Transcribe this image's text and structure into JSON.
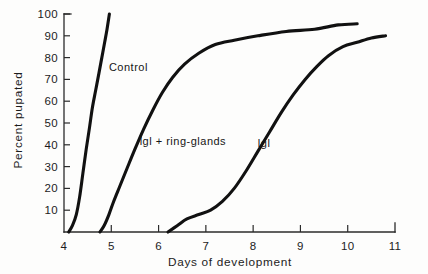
{
  "chart_data": {
    "type": "line",
    "title": "",
    "xlabel": "Days of development",
    "ylabel": "Percent pupated",
    "xlim": [
      4,
      11
    ],
    "ylim": [
      0,
      100
    ],
    "grid": false,
    "legend_position": "inline-annotations",
    "xticks": [
      "4",
      "5",
      "6",
      "7",
      "8",
      "9",
      "10",
      "11"
    ],
    "xtick_values": [
      4,
      5,
      6,
      7,
      8,
      9,
      10,
      11
    ],
    "yticks": [
      "10",
      "20",
      "30",
      "40",
      "50",
      "60",
      "70",
      "80",
      "90",
      "100"
    ],
    "ytick_values": [
      10,
      20,
      30,
      40,
      50,
      60,
      70,
      80,
      90,
      100
    ],
    "series": [
      {
        "name": "Control",
        "label": "Control",
        "label_x": 4.95,
        "label_y": 74,
        "points": [
          [
            4.1,
            0
          ],
          [
            4.18,
            3
          ],
          [
            4.26,
            8
          ],
          [
            4.33,
            16
          ],
          [
            4.4,
            27
          ],
          [
            4.47,
            38
          ],
          [
            4.54,
            48
          ],
          [
            4.6,
            57
          ],
          [
            4.67,
            65
          ],
          [
            4.74,
            73
          ],
          [
            4.8,
            80
          ],
          [
            4.86,
            87
          ],
          [
            4.91,
            93
          ],
          [
            4.96,
            100
          ]
        ]
      },
      {
        "name": "lgl + ring-glands",
        "label": "lgl + ring-glands",
        "label_x": 5.6,
        "label_y": 40,
        "points": [
          [
            4.76,
            0
          ],
          [
            4.85,
            3
          ],
          [
            4.95,
            8
          ],
          [
            5.05,
            14
          ],
          [
            5.18,
            21
          ],
          [
            5.33,
            29
          ],
          [
            5.5,
            38
          ],
          [
            5.68,
            47
          ],
          [
            5.88,
            56
          ],
          [
            6.08,
            64
          ],
          [
            6.3,
            71
          ],
          [
            6.55,
            77
          ],
          [
            6.85,
            82
          ],
          [
            7.2,
            86
          ],
          [
            7.6,
            88
          ],
          [
            8.1,
            90
          ],
          [
            8.7,
            92
          ],
          [
            9.3,
            93
          ],
          [
            9.8,
            95
          ],
          [
            10.2,
            95.5
          ]
        ]
      },
      {
        "name": "lgl",
        "label": "lgl",
        "label_x": 8.1,
        "label_y": 39,
        "points": [
          [
            6.2,
            0
          ],
          [
            6.4,
            3
          ],
          [
            6.6,
            6
          ],
          [
            6.85,
            8
          ],
          [
            7.1,
            10
          ],
          [
            7.35,
            14
          ],
          [
            7.6,
            20
          ],
          [
            7.85,
            28
          ],
          [
            8.1,
            37
          ],
          [
            8.35,
            46
          ],
          [
            8.6,
            55
          ],
          [
            8.85,
            63
          ],
          [
            9.1,
            70
          ],
          [
            9.35,
            76
          ],
          [
            9.6,
            81
          ],
          [
            9.9,
            85
          ],
          [
            10.2,
            87
          ],
          [
            10.5,
            89
          ],
          [
            10.8,
            90
          ]
        ]
      }
    ]
  }
}
